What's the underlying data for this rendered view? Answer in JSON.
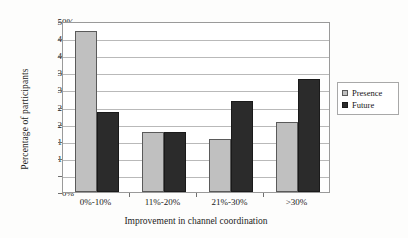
{
  "chart_data": {
    "type": "bar",
    "title": "",
    "xlabel": "Improvement in channel coordination",
    "ylabel": "Percentage of participants",
    "categories": [
      "0%-10%",
      "11%-20%",
      "21%-30%",
      ">30%"
    ],
    "series": [
      {
        "name": "Presence",
        "color": "#c0c0c0",
        "values": [
          47,
          17.5,
          15.5,
          20.5
        ]
      },
      {
        "name": "Future",
        "color": "#2b2b2b",
        "values": [
          23.5,
          17.5,
          26.5,
          33
        ]
      }
    ],
    "ylim": [
      0,
      50
    ],
    "ytick_step": 5,
    "ytick_labels": [
      "50%",
      "45%",
      "40%",
      "35%",
      "30%",
      "25%",
      "20%",
      "15%",
      "10%",
      "5%",
      "0%"
    ],
    "ytick_values": [
      50,
      45,
      40,
      35,
      30,
      25,
      20,
      15,
      10,
      5,
      0
    ],
    "grid": true,
    "grid_axis": "y",
    "legend_position": "right",
    "legend_entries": [
      "Presence",
      "Future"
    ]
  }
}
